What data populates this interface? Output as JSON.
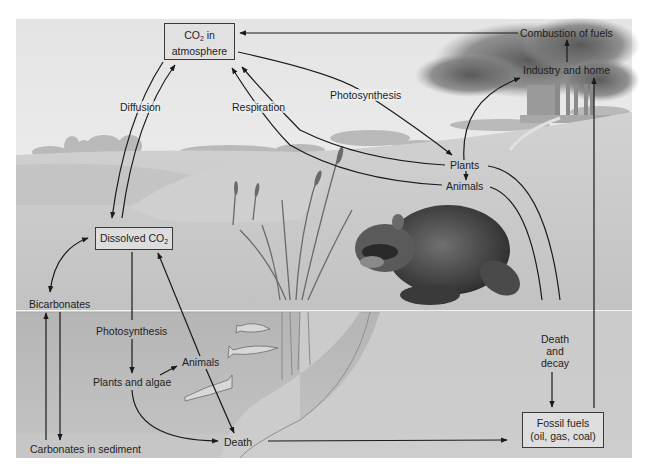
{
  "diagram": {
    "type": "carbon-cycle",
    "style": "grayscale illustration",
    "nodes": {
      "co2_atmosphere": {
        "line1_pre": "CO",
        "line1_sub": "2",
        "line1_post": " in",
        "line2": "atmosphere"
      },
      "dissolved_co2": {
        "pre": "Dissolved CO",
        "sub": "2"
      },
      "fossil_fuels": {
        "line1": "Fossil fuels",
        "line2": "(oil, gas, coal)"
      },
      "combustion": "Combustion of fuels",
      "industry": "Industry and home",
      "plants": "Plants",
      "animals_land": "Animals",
      "death_decay": {
        "line1": "Death",
        "line2": "and",
        "line3": "decay"
      },
      "bicarbonates": "Bicarbonates",
      "carbonates": "Carbonates in sediment",
      "plants_algae": "Plants and algae",
      "animals_water": "Animals",
      "death": "Death"
    },
    "process_labels": {
      "diffusion": "Diffusion",
      "respiration": "Respiration",
      "photosynthesis_land": "Photosynthesis",
      "photosynthesis_water": "Photosynthesis"
    },
    "edges": [
      {
        "from": "Combustion of fuels",
        "to": "CO2 in atmosphere"
      },
      {
        "from": "Industry and home",
        "to": "Combustion of fuels"
      },
      {
        "from": "Plants",
        "to": "Industry and home"
      },
      {
        "from": "Fossil fuels",
        "to": "Industry and home"
      },
      {
        "from": "CO2 in atmosphere",
        "to": "Plants",
        "label": "Photosynthesis"
      },
      {
        "from": "Plants",
        "to": "CO2 in atmosphere",
        "label": "Respiration"
      },
      {
        "from": "Animals",
        "to": "CO2 in atmosphere",
        "label": "Respiration"
      },
      {
        "from": "Plants",
        "to": "Animals"
      },
      {
        "from": "Plants",
        "to": "Death and decay"
      },
      {
        "from": "Animals",
        "to": "Death and decay"
      },
      {
        "from": "Death and decay",
        "to": "Fossil fuels"
      },
      {
        "from": "CO2 in atmosphere",
        "to": "Dissolved CO2",
        "label": "Diffusion"
      },
      {
        "from": "Dissolved CO2",
        "to": "CO2 in atmosphere",
        "label": "Diffusion"
      },
      {
        "from": "Dissolved CO2",
        "to": "Bicarbonates"
      },
      {
        "from": "Bicarbonates",
        "to": "Dissolved CO2"
      },
      {
        "from": "Bicarbonates",
        "to": "Carbonates in sediment"
      },
      {
        "from": "Carbonates in sediment",
        "to": "Bicarbonates"
      },
      {
        "from": "Dissolved CO2",
        "to": "Plants and algae",
        "label": "Photosynthesis"
      },
      {
        "from": "Plants and algae",
        "to": "Animals"
      },
      {
        "from": "Animals",
        "to": "Dissolved CO2"
      },
      {
        "from": "Animals",
        "to": "Death"
      },
      {
        "from": "Plants and algae",
        "to": "Death"
      },
      {
        "from": "Death",
        "to": "Fossil fuels"
      }
    ],
    "colors": {
      "sky_top": "#ececec",
      "sky_bottom": "#f7f7f7",
      "land": "#c9c9c9",
      "water": "#b8b8b8",
      "sediment": "#c4c4c4",
      "smoke": "#6b6b6b",
      "line": "#1a1a1a",
      "text": "#1e1e1e"
    }
  }
}
